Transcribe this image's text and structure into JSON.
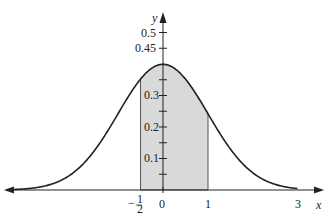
{
  "chart_data": {
    "type": "area",
    "title": "",
    "function": "y = (1/sqrt(2*pi)) * exp(-x^2/2)",
    "xlabel": "x",
    "ylabel": "y",
    "xlim": [
      -3.6,
      3.5
    ],
    "ylim": [
      0,
      0.55
    ],
    "x_ticks": [
      {
        "value": -0.5,
        "label": "-1/2"
      },
      {
        "value": 0,
        "label": "0"
      },
      {
        "value": 1,
        "label": "1"
      },
      {
        "value": 3,
        "label": "3"
      }
    ],
    "y_ticks": [
      {
        "value": 0.05,
        "label": ""
      },
      {
        "value": 0.1,
        "label": "0.1"
      },
      {
        "value": 0.15,
        "label": ""
      },
      {
        "value": 0.2,
        "label": "0.2"
      },
      {
        "value": 0.25,
        "label": ""
      },
      {
        "value": 0.3,
        "label": "0.3"
      },
      {
        "value": 0.35,
        "label": ""
      },
      {
        "value": 0.45,
        "label": "0.45"
      },
      {
        "value": 0.5,
        "label": "0.5"
      }
    ],
    "shaded_region": {
      "from": -0.5,
      "to": 1
    },
    "grid": false,
    "colors": {
      "curve": "#222222",
      "fill": "#d9d9d9",
      "axis": "#222222"
    }
  },
  "labels": {
    "x_axis": "x",
    "y_axis": "y",
    "tick_neg_half_minus": "−",
    "tick_neg_half_num": "1",
    "tick_neg_half_den": "2",
    "tick_0": "0",
    "tick_1": "1",
    "tick_3": "3",
    "ytick_01": "0.1",
    "ytick_02": "0.2",
    "ytick_03": "0.3",
    "ytick_045": "0.45",
    "ytick_05": "0.5"
  }
}
